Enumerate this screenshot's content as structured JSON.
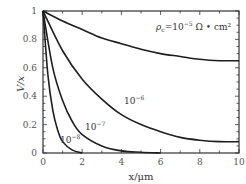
{
  "chart_data": {
    "type": "line",
    "title": "",
    "xlabel": "x/μm",
    "ylabel": "V/x",
    "xlim": [
      0,
      10
    ],
    "ylim": [
      0,
      1
    ],
    "xticks": [
      0,
      2,
      4,
      6,
      8,
      10
    ],
    "yticks": [
      0,
      0.2,
      0.4,
      0.6,
      0.8,
      1
    ],
    "ytick_labels": [
      "0",
      "0.2",
      "0.4",
      "0.6",
      "0.8",
      "1"
    ],
    "xtick_labels": [
      "0",
      "2",
      "4",
      "6",
      "8",
      "10"
    ],
    "grid": false,
    "annotation": "ρc=10⁻⁵ Ω·cm²",
    "series": [
      {
        "name": "10⁻⁵",
        "x": [
          0,
          1,
          2,
          3,
          4,
          5,
          6,
          7,
          8,
          9,
          10
        ],
        "values": [
          1.0,
          0.93,
          0.87,
          0.81,
          0.77,
          0.73,
          0.7,
          0.68,
          0.66,
          0.65,
          0.65
        ]
      },
      {
        "name": "10⁻⁶",
        "x": [
          0,
          1,
          2,
          3,
          4,
          5,
          6,
          7,
          8,
          9,
          10
        ],
        "values": [
          1.0,
          0.72,
          0.52,
          0.38,
          0.27,
          0.2,
          0.15,
          0.11,
          0.09,
          0.08,
          0.08
        ]
      },
      {
        "name": "10⁻⁷",
        "x": [
          0,
          0.5,
          1,
          1.5,
          2,
          3,
          4,
          5,
          6
        ],
        "values": [
          1.0,
          0.6,
          0.37,
          0.22,
          0.13,
          0.05,
          0.015,
          0.005,
          0.0
        ]
      },
      {
        "name": "10⁻⁸",
        "x": [
          0,
          0.25,
          0.5,
          0.75,
          1,
          1.5,
          2
        ],
        "values": [
          1.0,
          0.55,
          0.3,
          0.16,
          0.08,
          0.02,
          0.0
        ]
      }
    ]
  },
  "labels": {
    "annotation_rho": "ρ",
    "annotation_sub": "c",
    "annotation_eq": "=10",
    "annotation_exp": "−5",
    "annotation_unit": "Ω • cm²",
    "curve_1e6": "10",
    "curve_1e6_exp": "−6",
    "curve_1e7": "10",
    "curve_1e7_exp": "−7",
    "curve_1e8": "10",
    "curve_1e8_exp": "−8"
  }
}
